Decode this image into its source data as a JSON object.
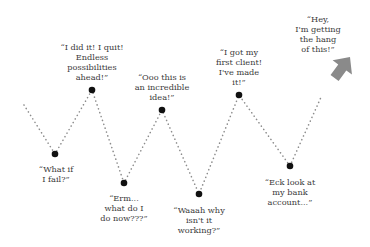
{
  "diagram": {
    "type": "emotional-journey-zigzag",
    "line_color": "#8c8c8c",
    "point_color": "#111111",
    "arrow_color": "#8a8a8a",
    "text_color": "#3a3a3a",
    "start": {
      "x": 24,
      "y": 105
    },
    "arrow": {
      "tail_x": 322,
      "tail_y": 95,
      "tip_x": 350,
      "tip_y": 57
    },
    "points": [
      {
        "x": 55,
        "y": 154,
        "label": "“What if\nI fail?”",
        "label_x": 56,
        "label_y": 164
      },
      {
        "x": 92,
        "y": 90,
        "label": "“I did it! I quit!\nEndless\npossibilities\nahead!”",
        "label_x": 92,
        "label_y": 42
      },
      {
        "x": 124,
        "y": 183,
        "label": "“Erm...\nwhat do I\ndo now???”",
        "label_x": 124,
        "label_y": 193
      },
      {
        "x": 162,
        "y": 110,
        "label": "“Ooo this is\nan incredible\nidea!”",
        "label_x": 162,
        "label_y": 72
      },
      {
        "x": 199,
        "y": 194,
        "label": "“Waaah why\nisn't it\nworking?”",
        "label_x": 199,
        "label_y": 205
      },
      {
        "x": 239,
        "y": 95,
        "label": "“I got my\nfirst client!\nI've made\nit!”",
        "label_x": 239,
        "label_y": 47
      },
      {
        "x": 290,
        "y": 166,
        "label": "“Eck look at\nmy bank\naccount...”",
        "label_x": 290,
        "label_y": 177
      }
    ],
    "final_label": {
      "text": "“Hey,\nI'm getting\nthe hang\nof this!”",
      "x": 318,
      "y": 14
    }
  }
}
